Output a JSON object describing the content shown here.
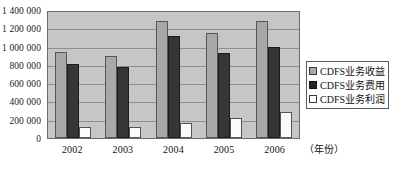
{
  "chart_data": {
    "type": "bar",
    "title": "",
    "subtitle": "",
    "xlabel": "（年份）",
    "ylabel": "",
    "categories": [
      "2002",
      "2003",
      "2004",
      "2005",
      "2006"
    ],
    "series": [
      {
        "name": "CDFS业务收益",
        "color": "#a8a8a8",
        "values": [
          940000,
          900000,
          1285000,
          1150000,
          1285000
        ]
      },
      {
        "name": "CDFS业务费用",
        "color": "#363636",
        "values": [
          815000,
          775000,
          1115000,
          930000,
          995000
        ]
      },
      {
        "name": "CDFS业务利润",
        "color": "#ffffff",
        "values": [
          125000,
          120000,
          165000,
          215000,
          290000
        ]
      }
    ],
    "ylim": [
      0,
      1400000
    ],
    "ytick_values": [
      0,
      200000,
      400000,
      600000,
      800000,
      1000000,
      1200000,
      1400000
    ],
    "ytick_labels": [
      "0",
      "200 000",
      "400 000",
      "600 000",
      "800 000",
      "1 000 000",
      "1 200 000",
      "1 400 000"
    ],
    "grid": true,
    "legend_position": "right",
    "plot_background": "#c6c6c6"
  },
  "legend": {
    "items": [
      {
        "label": "CDFS业务收益",
        "swatch": "revenue"
      },
      {
        "label": "CDFS业务费用",
        "swatch": "cost"
      },
      {
        "label": "CDFS业务利润",
        "swatch": "profit"
      }
    ]
  }
}
